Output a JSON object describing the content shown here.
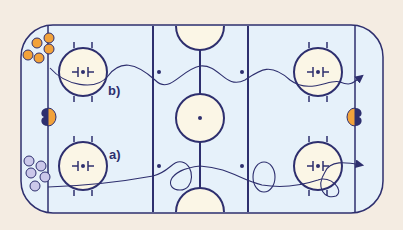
{
  "diagram": {
    "type": "ice-hockey-rink-drill",
    "colors": {
      "background": "#f4ece2",
      "ice": "#e6f1fa",
      "lines": "#2e2f6e",
      "circle_fill": "#fbf6e6",
      "team_orange": "#f2a23a",
      "team_lavender": "#cbc8ea"
    },
    "labels": {
      "drill_a": "a)",
      "drill_b": "b)"
    },
    "players": {
      "orange_group": {
        "count": 5,
        "location": "top-left corner"
      },
      "lavender_group": {
        "count": 5,
        "location": "bottom-left corner"
      }
    },
    "goalies": [
      {
        "side": "left",
        "colors": [
          "#2e2f6e",
          "#f2a23a"
        ]
      },
      {
        "side": "right",
        "colors": [
          "#f2a23a",
          "#2e2f6e"
        ]
      }
    ],
    "paths": [
      {
        "id": "b",
        "description": "wavy skating path from left faceoff circle to right end ending in arrow"
      },
      {
        "id": "a",
        "description": "skating path with loops from left faceoff circle to right faceoff circle ending in arrow"
      }
    ]
  }
}
